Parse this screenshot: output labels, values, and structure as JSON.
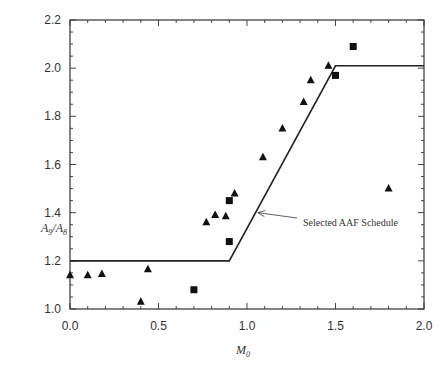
{
  "chart_data": {
    "type": "scatter",
    "title": "",
    "xlabel": "M0",
    "ylabel": "A9/A8",
    "xlim": [
      0.0,
      2.0
    ],
    "ylim": [
      1.0,
      2.2
    ],
    "x_ticks": [
      "0.0",
      "0.5",
      "1.0",
      "1.5",
      "2.0"
    ],
    "y_ticks": [
      "1.0",
      "1.2",
      "1.4",
      "1.6",
      "1.8",
      "2.0",
      "2.2"
    ],
    "grid": false,
    "legend": null,
    "series": [
      {
        "name": "triangles",
        "marker": "triangle",
        "points": [
          [
            0.0,
            1.14
          ],
          [
            0.1,
            1.14
          ],
          [
            0.18,
            1.145
          ],
          [
            0.4,
            1.03
          ],
          [
            0.44,
            1.165
          ],
          [
            0.77,
            1.36
          ],
          [
            0.82,
            1.39
          ],
          [
            0.88,
            1.385
          ],
          [
            0.93,
            1.48
          ],
          [
            1.09,
            1.63
          ],
          [
            1.2,
            1.75
          ],
          [
            1.32,
            1.86
          ],
          [
            1.36,
            1.95
          ],
          [
            1.46,
            2.01
          ],
          [
            1.8,
            1.5
          ]
        ]
      },
      {
        "name": "squares",
        "marker": "square",
        "points": [
          [
            0.7,
            1.08
          ],
          [
            0.9,
            1.28
          ],
          [
            0.9,
            1.45
          ],
          [
            1.5,
            1.97
          ],
          [
            1.6,
            2.09
          ]
        ]
      },
      {
        "name": "Selected AAF Schedule",
        "marker": "line",
        "points": [
          [
            0.0,
            1.2
          ],
          [
            0.9,
            1.2
          ],
          [
            1.5,
            2.01
          ],
          [
            2.0,
            2.01
          ]
        ]
      }
    ],
    "annotations": [
      {
        "text": "Selected AAF Schedule",
        "arrow_to": [
          1.05,
          1.4
        ],
        "text_at": [
          1.3,
          1.36
        ]
      }
    ]
  },
  "labels": {
    "ylabel_main": "A",
    "ylabel_sub1": "9",
    "ylabel_div": "/A",
    "ylabel_sub2": "8",
    "xlabel_main": "M",
    "xlabel_sub": "0",
    "annotation": "Selected AAF Schedule"
  }
}
